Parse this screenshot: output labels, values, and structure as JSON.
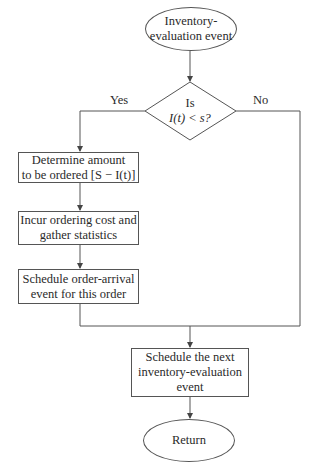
{
  "start_node": {
    "line1": "Inventory-",
    "line2": "evaluation event"
  },
  "decision": {
    "line1": "Is",
    "line2": "I(t) < s?"
  },
  "branches": {
    "yes": "Yes",
    "no": "No"
  },
  "steps": [
    {
      "line1": "Determine amount",
      "line2": "to be ordered [S − I(t)]"
    },
    {
      "line1": "Incur ordering cost and",
      "line2": "gather statistics"
    },
    {
      "line1": "Schedule order-arrival",
      "line2": "event for this order"
    }
  ],
  "next_event": {
    "line1": "Schedule the next",
    "line2": "inventory-evaluation",
    "line3": "event"
  },
  "end_node": {
    "label": "Return"
  }
}
